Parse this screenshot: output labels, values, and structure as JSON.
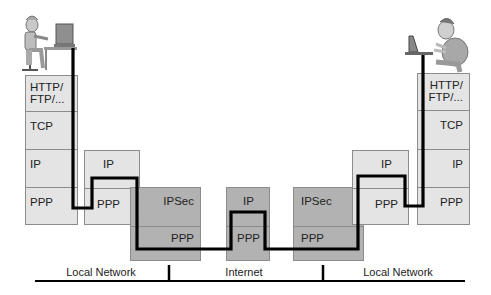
{
  "diagram": {
    "left_host": {
      "layers": [
        "HTTP/\nFTP/...",
        "TCP",
        "IP",
        "PPP"
      ]
    },
    "left_router": {
      "layers": [
        "IP",
        "PPP"
      ]
    },
    "left_gateway": {
      "layers": [
        "IPSec",
        "PPP"
      ]
    },
    "internet_router": {
      "layers": [
        "IP",
        "PPP"
      ]
    },
    "right_gateway": {
      "layers": [
        "IPSec",
        "PPP"
      ]
    },
    "right_router": {
      "layers": [
        "IP",
        "PPP"
      ]
    },
    "right_host": {
      "layers": [
        "HTTP/\nFTP/...",
        "TCP",
        "IP",
        "PPP"
      ]
    },
    "network_segments": [
      "Local Network",
      "Internet",
      "Local Network"
    ],
    "colors": {
      "light_box": "#e4e4e4",
      "dark_box": "#b2b2b2",
      "path_line": "#000000"
    }
  }
}
